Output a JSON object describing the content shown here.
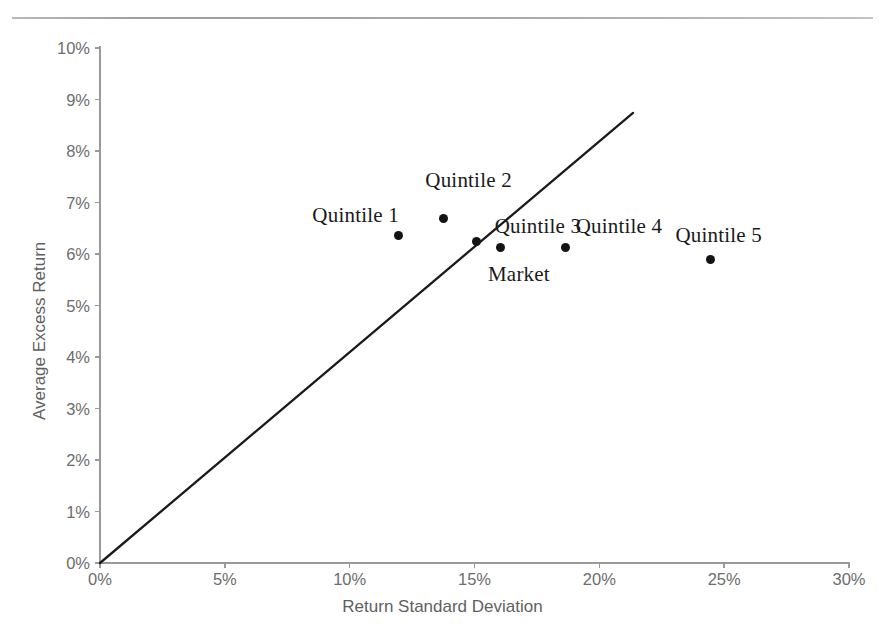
{
  "chart_data": {
    "type": "scatter",
    "title": "",
    "xlabel": "Return Standard Deviation",
    "ylabel": "Average Excess Return",
    "xlim": [
      0,
      30
    ],
    "ylim": [
      0,
      10
    ],
    "x_unit": "%",
    "y_unit": "%",
    "grid": false,
    "legend": "none",
    "xticks": [
      "0%",
      "5%",
      "10%",
      "15%",
      "20%",
      "25%",
      "30%"
    ],
    "xtick_values": [
      0,
      5,
      10,
      15,
      20,
      25,
      30
    ],
    "yticks": [
      "0%",
      "1%",
      "2%",
      "3%",
      "4%",
      "5%",
      "6%",
      "7%",
      "8%",
      "9%",
      "10%"
    ],
    "ytick_values": [
      0,
      1,
      2,
      3,
      4,
      5,
      6,
      7,
      8,
      9,
      10
    ],
    "points": [
      {
        "label": "Quintile 1",
        "x": 11.95,
        "y": 6.35,
        "label_dx": -86,
        "label_dy": -22
      },
      {
        "label": "Quintile 2",
        "x": 13.75,
        "y": 6.68,
        "label_dx": -18,
        "label_dy": -40
      },
      {
        "label": "Market",
        "x": 15.1,
        "y": 6.24,
        "label_dx": 11,
        "label_dy": 31
      },
      {
        "label": "Quintile 3",
        "x": 16.05,
        "y": 6.12,
        "label_dx": -6,
        "label_dy": -23
      },
      {
        "label": "Quintile 4",
        "x": 18.65,
        "y": 6.12,
        "label_dx": 10,
        "label_dy": -23
      },
      {
        "label": "Quintile 5",
        "x": 24.45,
        "y": 5.9,
        "label_dx": -35,
        "label_dy": -25
      }
    ],
    "series": [
      {
        "name": "Capital Market Line",
        "type": "line",
        "x": [
          0,
          21.35
        ],
        "y": [
          0,
          8.74
        ],
        "color": "#1a1a1a"
      }
    ]
  },
  "figure": {
    "ghost_caption": "",
    "rule_color": "#aaaaaa",
    "axis_color": "#9a9a9a",
    "tick_label_color": "#6d6d6d",
    "axis_title_color": "#5f5f5f",
    "point_color": "#141414",
    "label_color": "#1a1a1a"
  }
}
